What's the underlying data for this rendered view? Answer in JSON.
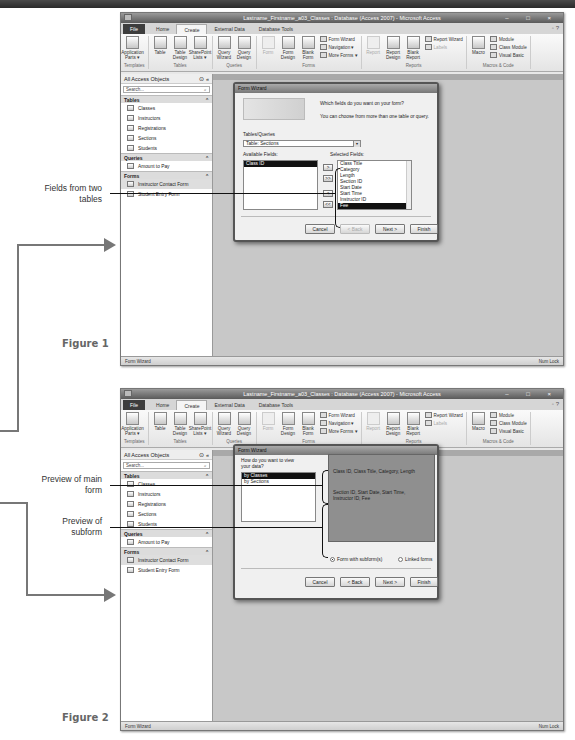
{
  "app": {
    "title": "Lastname_Firstname_a03_Classes : Database (Access 2007) - Microsoft Access",
    "window_controls": "– □ ×",
    "tabs": [
      "File",
      "Home",
      "Create",
      "External Data",
      "Database Tools"
    ],
    "active_tab": "Create",
    "ribbon": {
      "templates": {
        "label": "Templates",
        "buttons": [
          "Application Parts ▾"
        ]
      },
      "tables": {
        "label": "Tables",
        "buttons": [
          "Table",
          "Table Design",
          "SharePoint Lists ▾"
        ]
      },
      "queries": {
        "label": "Queries",
        "buttons": [
          "Query Wizard",
          "Query Design"
        ]
      },
      "forms": {
        "label": "Forms",
        "buttons": [
          "Form",
          "Form Design",
          "Blank Form"
        ],
        "small": [
          "Form Wizard",
          "Navigation ▾",
          "More Forms ▾"
        ]
      },
      "reports": {
        "label": "Reports",
        "buttons": [
          "Report",
          "Report Design",
          "Blank Report"
        ],
        "small": [
          "Report Wizard",
          "Labels"
        ]
      },
      "macros": {
        "label": "Macros & Code",
        "buttons": [
          "Macro"
        ],
        "small": [
          "Module",
          "Class Module",
          "Visual Basic"
        ]
      }
    },
    "nav": {
      "header": "All Access Objects",
      "search_placeholder": "Search...",
      "sections": [
        {
          "title": "Tables",
          "items": [
            "Classes",
            "Instructors",
            "Registrations",
            "Sections",
            "Students"
          ]
        },
        {
          "title": "Queries",
          "items": [
            "Amount to Pay"
          ]
        },
        {
          "title": "Forms",
          "items": [
            "Instructor Contact Form",
            "Student Entry Form"
          ]
        }
      ]
    },
    "status": {
      "left": "Form Wizard",
      "right": "Num Lock"
    }
  },
  "figure1": {
    "label": "Figure 1",
    "dialog": {
      "title": "Form Wizard",
      "question": "Which fields do you want on your form?",
      "hint": "You can choose from more than one table or query.",
      "tables_label": "Tables/Queries",
      "tables_value": "Table: Sections",
      "available_label": "Available Fields:",
      "available_fields": [
        "Class ID"
      ],
      "selected_label": "Selected Fields:",
      "selected_fields": [
        "Class Title",
        "Category",
        "Length",
        "Section ID",
        "Start Date",
        "Start Time",
        "Instructor ID",
        "Fee"
      ],
      "move_buttons": [
        ">",
        ">>",
        "<",
        "<<"
      ],
      "buttons": {
        "cancel": "Cancel",
        "back": "< Back",
        "next": "Next >",
        "finish": "Finish"
      }
    },
    "callout": "Fields from two tables"
  },
  "figure2": {
    "label": "Figure 2",
    "dialog": {
      "title": "Form Wizard",
      "question": "How do you want to view your data?",
      "views": [
        "by Classes",
        "by Sections"
      ],
      "main_form_preview": "Class ID, Class Title, Category, Length",
      "subform_preview": "Section ID, Start Date, Start Time, Instructor ID, Fee",
      "radio_subform": "Form with subform(s)",
      "radio_linked": "Linked forms",
      "buttons": {
        "cancel": "Cancel",
        "back": "< Back",
        "next": "Next >",
        "finish": "Finish"
      }
    },
    "callouts": {
      "main": "Preview of main form",
      "sub": "Preview of subform"
    }
  }
}
